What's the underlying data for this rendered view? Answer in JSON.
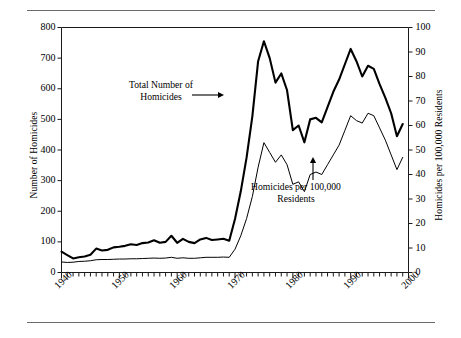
{
  "figure": {
    "has_top_rule": true,
    "has_bottom_rule": true,
    "rule_color": "#6b6b6b",
    "background": "#ffffff"
  },
  "chart_data": {
    "type": "line",
    "title": "",
    "xlabel": "",
    "ylabel": "Number of Homicides",
    "ylabel_right": "Homicides per 100,000 Residents",
    "xlim": [
      1940,
      2000
    ],
    "ylim": [
      0,
      800
    ],
    "ylim_right": [
      0,
      100
    ],
    "yticks": [
      0,
      100,
      200,
      300,
      400,
      500,
      600,
      700,
      800
    ],
    "yticks_right": [
      0,
      10,
      20,
      30,
      40,
      50,
      60,
      70,
      80,
      90,
      100
    ],
    "xticks_labeled": [
      1940,
      1950,
      1960,
      1970,
      1980,
      1990,
      2000
    ],
    "xticks_minor_interval": 1,
    "grid": false,
    "legend": "none",
    "x": [
      1940,
      1941,
      1942,
      1943,
      1944,
      1945,
      1946,
      1947,
      1948,
      1949,
      1950,
      1951,
      1952,
      1953,
      1954,
      1955,
      1956,
      1957,
      1958,
      1959,
      1960,
      1961,
      1962,
      1963,
      1964,
      1965,
      1966,
      1967,
      1968,
      1969,
      1970,
      1971,
      1972,
      1973,
      1974,
      1975,
      1976,
      1977,
      1978,
      1979,
      1980,
      1981,
      1982,
      1983,
      1984,
      1985,
      1986,
      1987,
      1988,
      1989,
      1990,
      1991,
      1992,
      1993,
      1994,
      1995,
      1996,
      1997,
      1998,
      1999
    ],
    "series": [
      {
        "name": "Total Number of Homicides",
        "axis": "left",
        "style": "thick",
        "linewidth": 2.1,
        "color": "#000000",
        "values": [
          68,
          57,
          46,
          50,
          52,
          58,
          78,
          72,
          74,
          82,
          84,
          87,
          92,
          90,
          96,
          98,
          105,
          97,
          100,
          120,
          97,
          110,
          100,
          96,
          108,
          113,
          106,
          108,
          110,
          104,
          175,
          265,
          375,
          510,
          690,
          755,
          700,
          620,
          650,
          595,
          465,
          480,
          425,
          500,
          505,
          490,
          540,
          590,
          630,
          680,
          730,
          690,
          640,
          675,
          665,
          615,
          570,
          520,
          445,
          485
        ]
      },
      {
        "name": "Homicides per 100,000 Residents",
        "axis": "right",
        "style": "thin",
        "linewidth": 1.0,
        "color": "#000000",
        "values": [
          4.3,
          4.1,
          4.2,
          4.5,
          4.6,
          4.8,
          5.2,
          5.3,
          5.3,
          5.4,
          5.5,
          5.5,
          5.6,
          5.6,
          5.7,
          5.8,
          5.9,
          5.8,
          5.9,
          6.2,
          5.8,
          6.0,
          5.8,
          5.8,
          6.0,
          6.2,
          6.2,
          6.2,
          6.3,
          6.2,
          9.5,
          15.0,
          22.0,
          31.0,
          43.0,
          53.0,
          49.0,
          45.0,
          48.0,
          44.0,
          36.0,
          37.0,
          33.0,
          40.0,
          41.0,
          40.0,
          44.0,
          48.0,
          52.0,
          58.0,
          64.0,
          62.0,
          61.0,
          65.0,
          64.0,
          59.0,
          54.0,
          48.0,
          42.0,
          47.0
        ]
      }
    ],
    "annotations": [
      {
        "id": "total-homicides-annotation",
        "text_line1": "Total Number of",
        "text_line2": "Homicides",
        "arrow": "right"
      },
      {
        "id": "rate-annotation",
        "text_line1": "Homicides per 100,000",
        "text_line2": "Residents",
        "arrow": "up"
      }
    ]
  },
  "axes": {
    "left_title": "Number of Homicides",
    "right_title": "Homicides per 100,000 Residents",
    "left_ticks": [
      "0",
      "100",
      "200",
      "300",
      "400",
      "500",
      "600",
      "700",
      "800"
    ],
    "right_ticks": [
      "0",
      "10",
      "20",
      "30",
      "40",
      "50",
      "60",
      "70",
      "80",
      "90",
      "100"
    ],
    "x_ticks": [
      "1940",
      "1950",
      "1960",
      "1970",
      "1980",
      "1990",
      "2000"
    ]
  }
}
